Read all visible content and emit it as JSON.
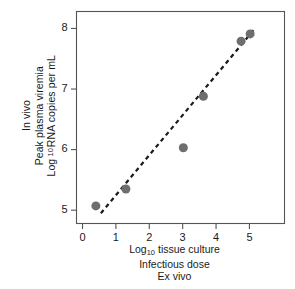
{
  "chart_data": {
    "type": "scatter",
    "title": "",
    "xlabel": "Log10 tissue culture Infectious dose Ex vivo",
    "ylabel": "In vivo Peak plasma viremia Log10 RNA copies per mL",
    "xlabel_lines": [
      "Log",
      "10",
      " tissue culture",
      "Infectious dose",
      "Ex vivo"
    ],
    "ylabel_lines": [
      "In vivo",
      "Peak plasma viremia",
      "Log",
      "10",
      " RNA copies per mL"
    ],
    "xlim": [
      -0.18,
      6.05
    ],
    "ylim": [
      4.78,
      8.28
    ],
    "grid": false,
    "legend": "none",
    "x_ticks": [
      0,
      1,
      2,
      3,
      4,
      5
    ],
    "x_tick_labels": [
      "0",
      "1",
      "2",
      "3",
      "4",
      "5"
    ],
    "y_ticks": [
      5,
      6,
      7,
      8
    ],
    "y_tick_labels": [
      "5",
      "6",
      "7",
      "8"
    ],
    "series": [
      {
        "name": "samples",
        "marker": "circle",
        "marker_color": "#6e6e6e",
        "marker_size": 9,
        "points": [
          {
            "x": 0.4,
            "y": 5.07
          },
          {
            "x": 1.3,
            "y": 5.35
          },
          {
            "x": 3.02,
            "y": 6.03
          },
          {
            "x": 3.62,
            "y": 6.88
          },
          {
            "x": 4.75,
            "y": 7.79
          },
          {
            "x": 5.02,
            "y": 7.91
          }
        ]
      }
    ],
    "trendline": {
      "name": "fit",
      "style": "dashed",
      "color": "#1a1a1a",
      "width": 2.2,
      "x_start": 0.55,
      "y_start": 4.95,
      "x_end": 5.12,
      "y_end": 7.97
    },
    "axes_frame": {
      "color": "#555555",
      "width": 1.1
    }
  },
  "yaxis": {
    "line1": "In vivo",
    "line2": "Peak plasma viremia",
    "line3_a": "Log",
    "line3_sub": "10",
    "line3_b": " RNA copies per mL"
  },
  "xaxis": {
    "line1_a": "Log",
    "line1_sub": "10",
    "line1_b": " tissue culture",
    "line2": "Infectious dose",
    "line3": "Ex vivo"
  }
}
